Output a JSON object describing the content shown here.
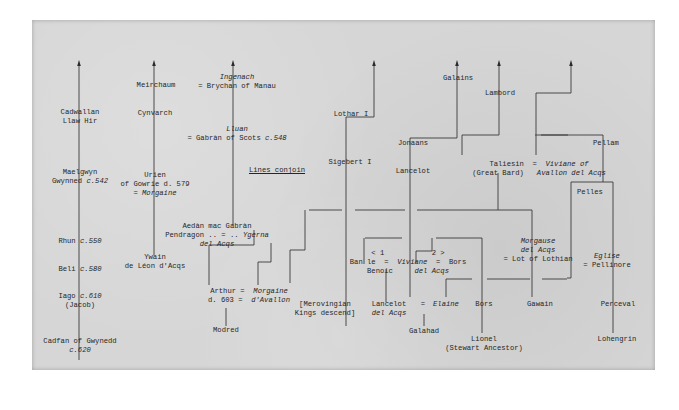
{
  "diagram": {
    "title": "Lines conjoin",
    "paper_color": "#d6d6d6",
    "ink_color": "#333333",
    "nodes": [
      {
        "id": "cadwallan",
        "x": 80,
        "y": 114,
        "lines": [
          "Cadwallan",
          "Llaw Hir"
        ]
      },
      {
        "id": "maelgwyn",
        "x": 80,
        "y": 174,
        "lines": [
          "Maelgwyn",
          "Gwynned c.542"
        ]
      },
      {
        "id": "rhun",
        "x": 80,
        "y": 243,
        "lines": [
          "Rhun c.550"
        ]
      },
      {
        "id": "beli",
        "x": 80,
        "y": 271,
        "lines": [
          "Beli c.580"
        ]
      },
      {
        "id": "iago",
        "x": 80,
        "y": 298,
        "lines": [
          "Iago c.610",
          "(Jacob)"
        ]
      },
      {
        "id": "cadfan",
        "x": 80,
        "y": 343,
        "lines": [
          "Cadfan of Gwynedd",
          "c.620"
        ]
      },
      {
        "id": "meirchaum",
        "x": 156,
        "y": 87,
        "lines": [
          "Meirchaum"
        ]
      },
      {
        "id": "cynvarch",
        "x": 155,
        "y": 115,
        "lines": [
          "Cynvarch"
        ]
      },
      {
        "id": "urien",
        "x": 155,
        "y": 177,
        "lines": [
          "Urien",
          "of Gowrie d. 579",
          "= Morgaine"
        ]
      },
      {
        "id": "ywain",
        "x": 155,
        "y": 259,
        "lines": [
          "Ywain",
          "de Léon d'Acqs"
        ]
      },
      {
        "id": "ingenach",
        "x": 237,
        "y": 79,
        "lines": [
          "Ingenach",
          "= Brychan of Manau"
        ]
      },
      {
        "id": "lluan",
        "x": 237,
        "y": 131,
        "lines": [
          "Lluan",
          "= Gabràn of Scots c.548"
        ]
      },
      {
        "id": "lines-conjoin",
        "x": 277,
        "y": 172,
        "lines": [
          "Lines conjoin"
        ],
        "underline": true
      },
      {
        "id": "aedan",
        "x": 217,
        "y": 228,
        "lines": [
          "Aedàn mac Gabràn",
          "Pendragon .. = .. Ygerna",
          "del Acqs"
        ]
      },
      {
        "id": "arthur",
        "x": 249,
        "y": 293,
        "lines": [
          "Arthur =  Morgaine",
          "d. 603 =  d'Avallon"
        ]
      },
      {
        "id": "modred",
        "x": 226,
        "y": 332,
        "lines": [
          "Modred"
        ]
      },
      {
        "id": "lothar",
        "x": 351,
        "y": 116,
        "lines": [
          "Lothar I"
        ]
      },
      {
        "id": "sigebert",
        "x": 350,
        "y": 164,
        "lines": [
          "Sigebert I"
        ]
      },
      {
        "id": "merovingian",
        "x": 325,
        "y": 306,
        "lines": [
          "[Merovingian",
          "Kings descend]"
        ]
      },
      {
        "id": "galains",
        "x": 458,
        "y": 80,
        "lines": [
          "Galains"
        ]
      },
      {
        "id": "jonaans",
        "x": 413,
        "y": 145,
        "lines": [
          "Jonaans"
        ]
      },
      {
        "id": "lancelot",
        "x": 413,
        "y": 173,
        "lines": [
          "Lancelot"
        ]
      },
      {
        "id": "lambord",
        "x": 500,
        "y": 95,
        "lines": [
          "Lambord"
        ]
      },
      {
        "id": "taliesin",
        "x": 539,
        "y": 166,
        "lines": [
          "Taliesin  =  Viviane of",
          "(Great Bard)   Avallon del Acqs"
        ]
      },
      {
        "id": "pellam",
        "x": 606,
        "y": 145,
        "lines": [
          "Pellam"
        ]
      },
      {
        "id": "pelles",
        "x": 590,
        "y": 194,
        "lines": [
          "Pelles"
        ]
      },
      {
        "id": "ban",
        "x": 408,
        "y": 255,
        "lines": [
          "< 1           2 >",
          "Ban le  =  Viviane  =  Bors",
          "Benoic     del Acqs"
        ]
      },
      {
        "id": "morgause",
        "x": 538,
        "y": 243,
        "lines": [
          "Morgause",
          "del Acqs",
          "= Lot of Lothian"
        ]
      },
      {
        "id": "eglise",
        "x": 607,
        "y": 258,
        "lines": [
          "Eglise",
          "= Pellinore"
        ]
      },
      {
        "id": "lancelot-del-acqs",
        "x": 389,
        "y": 306,
        "lines": [
          "Lancelot",
          "del Acqs"
        ]
      },
      {
        "id": "elaine-eq",
        "x": 423,
        "y": 306,
        "lines": [
          "="
        ]
      },
      {
        "id": "elaine",
        "x": 446,
        "y": 306,
        "lines": [
          "Elaine"
        ]
      },
      {
        "id": "bors2",
        "x": 484,
        "y": 306,
        "lines": [
          "Bors"
        ]
      },
      {
        "id": "gawain",
        "x": 540,
        "y": 306,
        "lines": [
          "Gawain"
        ]
      },
      {
        "id": "perceval",
        "x": 618,
        "y": 306,
        "lines": [
          "Perceval"
        ]
      },
      {
        "id": "galahad",
        "x": 424,
        "y": 333,
        "lines": [
          "Galahad"
        ]
      },
      {
        "id": "lionel",
        "x": 484,
        "y": 341,
        "lines": [
          "Lionel",
          "(Stewart Ancestor)"
        ]
      },
      {
        "id": "lohengrin",
        "x": 617,
        "y": 341,
        "lines": [
          "Lohengrin"
        ]
      }
    ],
    "italic_fragments": [
      "c.542",
      "c.550",
      "c.580",
      "c.610",
      "c.620",
      "c.548",
      "Morgaine",
      "Ingenach",
      "Lluan",
      "Ygerna",
      "del Acqs",
      "d'Avallon",
      "Viviane of",
      "Avallon del Acqs",
      "Viviane",
      "Morgause",
      "Eglise",
      "Elaine"
    ],
    "arrows": [
      {
        "x": 79,
        "y1": 60,
        "y2": 360
      },
      {
        "x": 154,
        "y1": 60,
        "y2": 255
      },
      {
        "x": 233,
        "y1": 60,
        "y2": 225
      },
      {
        "x": 374,
        "y1": 60,
        "y2": 117
      },
      {
        "x": 457,
        "y1": 60,
        "y2": 138
      },
      {
        "x": 499,
        "y1": 60,
        "y2": 135
      },
      {
        "x": 571,
        "y1": 60,
        "y2": 93
      }
    ],
    "paths": [
      "M374,117 L346,117 L346,326",
      "M457,138 L410,138 L410,297",
      "M499,135 L492,135 L462,135 L462,155",
      "M535,135 L568,135",
      "M571,93 L536,93 L536,155",
      "M541,135 L603,135 L603,182 L613,182 L613,333",
      "M587,182 L571,182 L571,278 L567,278",
      "M587,182 L603,182",
      "M233,225 L233,225",
      "M305,210 L305,250 L290,250 L290,283",
      "M309,210 L342,210",
      "M355,210 L405,210",
      "M417,210 L532,210 L532,297",
      "M498,173 L498,210",
      "M365,238 L402,238",
      "M409,238 L409,238",
      "M436,238 L482,238 L482,333",
      "M432,238 L432,251 L416,251 L416,263",
      "M364,238 L364,264",
      "M254,245 L254,230",
      "M271,262 L271,243",
      "M271,262 L258,262 L258,285",
      "M254,245 L209,245 L209,285",
      "M226,308 L226,326",
      "M386,270 L386,302",
      "M424,314 L424,326",
      "M446,297 L446,279 L472,279",
      "M487,279 L530,279",
      "M542,279 L565,279 L567,279"
    ]
  }
}
